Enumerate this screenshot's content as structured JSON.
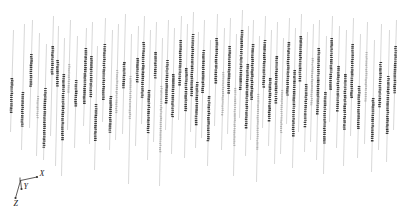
{
  "figure": {
    "title": "",
    "background_color": "#ffffff",
    "width": 403,
    "height": 216
  },
  "axis_triad": {
    "name": "coordinate-axis-triad",
    "origin": [
      20.5,
      180.5
    ],
    "axes": [
      {
        "label": "X",
        "direction": "right",
        "tip": [
          37.0,
          177.0
        ],
        "label_pos": [
          39.5,
          175.5
        ]
      },
      {
        "label": "Y",
        "direction": "down",
        "tip": [
          21.5,
          189.0
        ],
        "label_pos": [
          23.5,
          188.5
        ]
      },
      {
        "label": "Z",
        "direction": "down-left",
        "tip": [
          15.5,
          198.0
        ],
        "label_pos": [
          13.5,
          206.0
        ]
      }
    ],
    "line_color": "#33302e",
    "label_color": "#1a1a1a"
  },
  "chart_data": {
    "type": "scatter",
    "title": "",
    "xlabel": "X",
    "ylabel": "Y",
    "zlabel": "Z",
    "subtitle": "3D vertical track plot with highlighted dotted depth intervals",
    "grid": false,
    "legend": "none",
    "xlim": [
      0,
      403
    ],
    "ylim": [
      0,
      216
    ],
    "track_line_color": "#bdbdbd",
    "segment_dark_color": "#3b3b3b",
    "segment_light_color": "#b0b0b0",
    "tilt_dx": 3.0,
    "tracks": [
      {
        "x": 12,
        "y_top": 30,
        "y_bot": 132,
        "segments": [
          {
            "a": 78,
            "b": 112,
            "tone": "dark"
          }
        ]
      },
      {
        "x": 23,
        "y_top": 24,
        "y_bot": 150,
        "segments": [
          {
            "a": 92,
            "b": 126,
            "tone": "dark"
          }
        ]
      },
      {
        "x": 31,
        "y_top": 20,
        "y_bot": 128,
        "segments": [
          {
            "a": 54,
            "b": 86,
            "tone": "dark"
          }
        ]
      },
      {
        "x": 38,
        "y_top": 33,
        "y_bot": 156,
        "segments": [
          {
            "a": 96,
            "b": 118,
            "tone": "light"
          }
        ]
      },
      {
        "x": 45,
        "y_top": 44,
        "y_bot": 160,
        "segments": [
          {
            "a": 88,
            "b": 148,
            "tone": "dark"
          }
        ]
      },
      {
        "x": 52,
        "y_top": 16,
        "y_bot": 136,
        "segments": [
          {
            "a": 46,
            "b": 74,
            "tone": "dark"
          }
        ]
      },
      {
        "x": 57,
        "y_top": 26,
        "y_bot": 166,
        "segments": [
          {
            "a": 60,
            "b": 86,
            "tone": "dark"
          }
        ]
      },
      {
        "x": 63,
        "y_top": 38,
        "y_bot": 176,
        "segments": [
          {
            "a": 74,
            "b": 140,
            "tone": "dark"
          }
        ]
      },
      {
        "x": 69,
        "y_top": 20,
        "y_bot": 130,
        "segments": [
          {
            "a": 64,
            "b": 92,
            "tone": "light"
          }
        ]
      },
      {
        "x": 76,
        "y_top": 36,
        "y_bot": 148,
        "segments": [
          {
            "a": 80,
            "b": 106,
            "tone": "dark"
          }
        ]
      },
      {
        "x": 85,
        "y_top": 28,
        "y_bot": 126,
        "segments": [
          {
            "a": 48,
            "b": 104,
            "tone": "dark"
          }
        ]
      },
      {
        "x": 91,
        "y_top": 22,
        "y_bot": 144,
        "segments": [
          {
            "a": 56,
            "b": 96,
            "tone": "dark"
          }
        ]
      },
      {
        "x": 96,
        "y_top": 46,
        "y_bot": 170,
        "segments": [
          {
            "a": 104,
            "b": 140,
            "tone": "dark"
          }
        ]
      },
      {
        "x": 104,
        "y_top": 18,
        "y_bot": 122,
        "segments": [
          {
            "a": 44,
            "b": 100,
            "tone": "dark"
          }
        ]
      },
      {
        "x": 111,
        "y_top": 30,
        "y_bot": 150,
        "segments": [
          {
            "a": 96,
            "b": 132,
            "tone": "dark"
          }
        ]
      },
      {
        "x": 117,
        "y_top": 24,
        "y_bot": 140,
        "segments": [
          {
            "a": 70,
            "b": 112,
            "tone": "light"
          }
        ]
      },
      {
        "x": 124,
        "y_top": 14,
        "y_bot": 134,
        "segments": [
          {
            "a": 62,
            "b": 88,
            "tone": "dark"
          }
        ]
      },
      {
        "x": 130,
        "y_top": 34,
        "y_bot": 184,
        "segments": [
          {
            "a": 76,
            "b": 120,
            "tone": "light"
          }
        ]
      },
      {
        "x": 137,
        "y_top": 26,
        "y_bot": 146,
        "segments": [
          {
            "a": 58,
            "b": 82,
            "tone": "dark"
          }
        ]
      },
      {
        "x": 143,
        "y_top": 16,
        "y_bot": 124,
        "segments": [
          {
            "a": 42,
            "b": 98,
            "tone": "dark"
          }
        ]
      },
      {
        "x": 149,
        "y_top": 30,
        "y_bot": 160,
        "segments": [
          {
            "a": 90,
            "b": 134,
            "tone": "dark"
          }
        ]
      },
      {
        "x": 155,
        "y_top": 22,
        "y_bot": 142,
        "segments": [
          {
            "a": 52,
            "b": 78,
            "tone": "dark"
          }
        ]
      },
      {
        "x": 161,
        "y_top": 38,
        "y_bot": 186,
        "segments": [
          {
            "a": 86,
            "b": 152,
            "tone": "light"
          }
        ]
      },
      {
        "x": 167,
        "y_top": 20,
        "y_bot": 130,
        "segments": [
          {
            "a": 60,
            "b": 102,
            "tone": "dark"
          }
        ]
      },
      {
        "x": 173,
        "y_top": 28,
        "y_bot": 154,
        "segments": [
          {
            "a": 74,
            "b": 118,
            "tone": "dark"
          }
        ]
      },
      {
        "x": 180,
        "y_top": 16,
        "y_bot": 120,
        "segments": [
          {
            "a": 40,
            "b": 86,
            "tone": "dark"
          }
        ]
      },
      {
        "x": 186,
        "y_top": 24,
        "y_bot": 158,
        "segments": [
          {
            "a": 68,
            "b": 110,
            "tone": "dark"
          }
        ]
      },
      {
        "x": 192,
        "y_top": 12,
        "y_bot": 132,
        "segments": [
          {
            "a": 34,
            "b": 96,
            "tone": "dark"
          }
        ]
      },
      {
        "x": 197,
        "y_top": 32,
        "y_bot": 148,
        "segments": [
          {
            "a": 82,
            "b": 124,
            "tone": "dark"
          }
        ]
      },
      {
        "x": 203,
        "y_top": 20,
        "y_bot": 138,
        "segments": [
          {
            "a": 50,
            "b": 92,
            "tone": "dark"
          }
        ]
      },
      {
        "x": 209,
        "y_top": 40,
        "y_bot": 166,
        "segments": [
          {
            "a": 96,
            "b": 142,
            "tone": "dark"
          }
        ]
      },
      {
        "x": 216,
        "y_top": 14,
        "y_bot": 126,
        "segments": [
          {
            "a": 38,
            "b": 84,
            "tone": "dark"
          }
        ]
      },
      {
        "x": 223,
        "y_top": 28,
        "y_bot": 150,
        "segments": [
          {
            "a": 72,
            "b": 116,
            "tone": "light"
          }
        ]
      },
      {
        "x": 229,
        "y_top": 18,
        "y_bot": 134,
        "segments": [
          {
            "a": 46,
            "b": 94,
            "tone": "dark"
          }
        ]
      },
      {
        "x": 235,
        "y_top": 34,
        "y_bot": 176,
        "segments": [
          {
            "a": 88,
            "b": 146,
            "tone": "light"
          }
        ]
      },
      {
        "x": 241,
        "y_top": 10,
        "y_bot": 118,
        "segments": [
          {
            "a": 30,
            "b": 90,
            "tone": "dark"
          }
        ]
      },
      {
        "x": 247,
        "y_top": 26,
        "y_bot": 156,
        "segments": [
          {
            "a": 64,
            "b": 128,
            "tone": "dark"
          }
        ]
      },
      {
        "x": 252,
        "y_top": 20,
        "y_bot": 140,
        "segments": [
          {
            "a": 44,
            "b": 100,
            "tone": "dark"
          }
        ]
      },
      {
        "x": 258,
        "y_top": 36,
        "y_bot": 182,
        "segments": [
          {
            "a": 94,
            "b": 150,
            "tone": "light"
          }
        ]
      },
      {
        "x": 264,
        "y_top": 16,
        "y_bot": 128,
        "segments": [
          {
            "a": 40,
            "b": 88,
            "tone": "dark"
          }
        ]
      },
      {
        "x": 270,
        "y_top": 30,
        "y_bot": 146,
        "segments": [
          {
            "a": 78,
            "b": 120,
            "tone": "dark"
          }
        ]
      },
      {
        "x": 276,
        "y_top": 22,
        "y_bot": 164,
        "segments": [
          {
            "a": 56,
            "b": 104,
            "tone": "dark"
          }
        ]
      },
      {
        "x": 282,
        "y_top": 38,
        "y_bot": 154,
        "segments": [
          {
            "a": 90,
            "b": 132,
            "tone": "light"
          }
        ]
      },
      {
        "x": 288,
        "y_top": 18,
        "y_bot": 124,
        "segments": [
          {
            "a": 42,
            "b": 96,
            "tone": "dark"
          }
        ]
      },
      {
        "x": 294,
        "y_top": 28,
        "y_bot": 168,
        "segments": [
          {
            "a": 70,
            "b": 136,
            "tone": "dark"
          }
        ]
      },
      {
        "x": 300,
        "y_top": 14,
        "y_bot": 132,
        "segments": [
          {
            "a": 36,
            "b": 82,
            "tone": "dark"
          }
        ]
      },
      {
        "x": 306,
        "y_top": 32,
        "y_bot": 152,
        "segments": [
          {
            "a": 84,
            "b": 126,
            "tone": "dark"
          }
        ]
      },
      {
        "x": 312,
        "y_top": 24,
        "y_bot": 142,
        "segments": [
          {
            "a": 58,
            "b": 106,
            "tone": "light"
          }
        ]
      },
      {
        "x": 318,
        "y_top": 20,
        "y_bot": 160,
        "segments": [
          {
            "a": 48,
            "b": 114,
            "tone": "dark"
          }
        ]
      },
      {
        "x": 325,
        "y_top": 36,
        "y_bot": 174,
        "segments": [
          {
            "a": 92,
            "b": 144,
            "tone": "dark"
          }
        ]
      },
      {
        "x": 331,
        "y_top": 16,
        "y_bot": 122,
        "segments": [
          {
            "a": 38,
            "b": 90,
            "tone": "dark"
          }
        ]
      },
      {
        "x": 338,
        "y_top": 26,
        "y_bot": 148,
        "segments": [
          {
            "a": 66,
            "b": 112,
            "tone": "dark"
          }
        ]
      },
      {
        "x": 345,
        "y_top": 30,
        "y_bot": 166,
        "segments": [
          {
            "a": 74,
            "b": 130,
            "tone": "dark"
          }
        ]
      },
      {
        "x": 352,
        "y_top": 18,
        "y_bot": 136,
        "segments": [
          {
            "a": 44,
            "b": 98,
            "tone": "dark"
          }
        ]
      },
      {
        "x": 359,
        "y_top": 34,
        "y_bot": 158,
        "segments": [
          {
            "a": 86,
            "b": 128,
            "tone": "dark"
          }
        ]
      },
      {
        "x": 366,
        "y_top": 22,
        "y_bot": 144,
        "segments": [
          {
            "a": 52,
            "b": 102,
            "tone": "light"
          }
        ]
      },
      {
        "x": 373,
        "y_top": 40,
        "y_bot": 172,
        "segments": [
          {
            "a": 98,
            "b": 140,
            "tone": "dark"
          }
        ]
      },
      {
        "x": 380,
        "y_top": 24,
        "y_bot": 150,
        "segments": [
          {
            "a": 62,
            "b": 108,
            "tone": "dark"
          }
        ]
      },
      {
        "x": 388,
        "y_top": 30,
        "y_bot": 162,
        "segments": [
          {
            "a": 76,
            "b": 134,
            "tone": "dark"
          }
        ]
      },
      {
        "x": 395,
        "y_top": 20,
        "y_bot": 130,
        "segments": [
          {
            "a": 46,
            "b": 94,
            "tone": "dark"
          }
        ]
      }
    ]
  }
}
